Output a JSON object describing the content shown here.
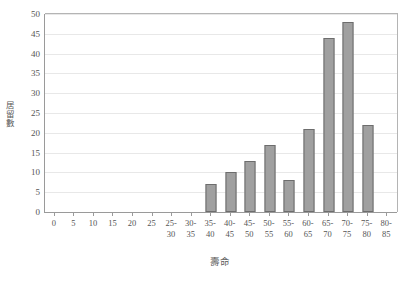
{
  "chart_data": {
    "type": "bar",
    "title": "",
    "subtitle": "",
    "xlabel": "壽命",
    "ylabel": "居留數",
    "ylim": [
      0,
      50
    ],
    "ytick_step": 5,
    "yticks": [
      0,
      5,
      10,
      15,
      20,
      25,
      30,
      35,
      40,
      45,
      50
    ],
    "grid": true,
    "legend": false,
    "legend_position": "none",
    "categories": [
      "0",
      "5",
      "10",
      "15",
      "20",
      "25",
      "25-30",
      "30-35",
      "35-40",
      "40-45",
      "45-50",
      "50-55",
      "55-60",
      "60-65",
      "65-70",
      "70-75",
      "75-80",
      "80-85"
    ],
    "values": [
      0,
      0,
      0,
      0,
      0,
      0,
      0,
      0,
      7,
      10,
      13,
      17,
      8,
      21,
      44,
      48,
      22,
      0
    ],
    "bar_color": "#a0a0a0",
    "bar_border_color": "#6d6d6d",
    "axis_color": "#9a9a9a",
    "gridline_color": "#e8e8e8",
    "background_color": "#ffffff",
    "text_color": "#555555"
  }
}
